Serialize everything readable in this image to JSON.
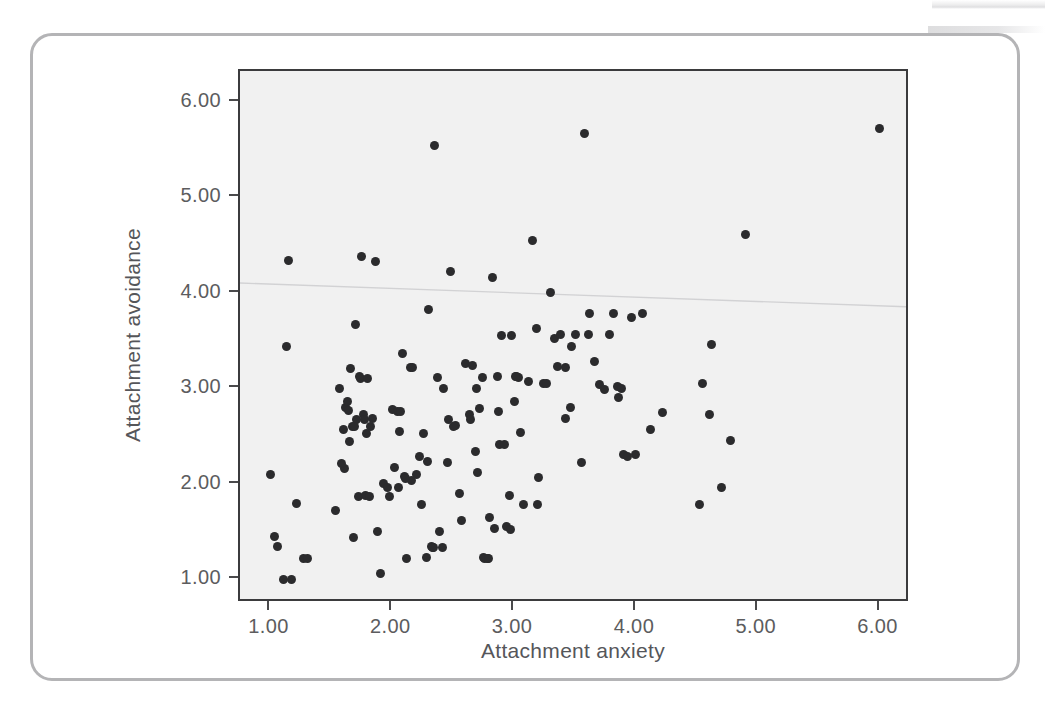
{
  "figure": {
    "background_color": "#ffffff",
    "card_border_color": "#b4b4b6",
    "panel_background_color": "#f1f1f1",
    "panel_border_color": "#3b3b3d",
    "point_color": "#2b2b2d",
    "fit_line_color": "#d2d2d4"
  },
  "chart_data": {
    "type": "scatter",
    "title": "",
    "xlabel": "Attachment anxiety",
    "ylabel": "Attachment avoidance",
    "xlim": [
      0.75,
      6.25
    ],
    "ylim": [
      0.75,
      6.32
    ],
    "xticks": [
      1.0,
      2.0,
      3.0,
      4.0,
      5.0,
      6.0
    ],
    "yticks": [
      1.0,
      2.0,
      3.0,
      4.0,
      5.0,
      6.0
    ],
    "xtick_labels": [
      "1.00",
      "2.00",
      "3.00",
      "4.00",
      "5.00",
      "6.00"
    ],
    "ytick_labels": [
      "1.00",
      "2.00",
      "3.00",
      "4.00",
      "5.00",
      "6.00"
    ],
    "grid": false,
    "legend": null,
    "n_points": 152,
    "marker": "filled-circle",
    "fit_line": {
      "visible": true,
      "x": [
        0.75,
        6.25
      ],
      "y": [
        4.1,
        3.85
      ],
      "note": "faint near-flat reference line"
    },
    "points": [
      [
        1.0,
        2.1
      ],
      [
        1.03,
        1.45
      ],
      [
        1.06,
        1.34
      ],
      [
        1.11,
        1.0
      ],
      [
        1.13,
        3.44
      ],
      [
        1.15,
        4.34
      ],
      [
        1.17,
        1.0
      ],
      [
        1.21,
        1.79
      ],
      [
        1.27,
        1.22
      ],
      [
        1.3,
        1.22
      ],
      [
        1.53,
        1.72
      ],
      [
        1.57,
        3.0
      ],
      [
        1.6,
        2.57
      ],
      [
        1.61,
        2.16
      ],
      [
        1.62,
        2.8
      ],
      [
        1.63,
        2.86
      ],
      [
        1.65,
        2.44
      ],
      [
        1.66,
        3.21
      ],
      [
        1.67,
        2.6
      ],
      [
        1.68,
        1.44
      ],
      [
        1.7,
        3.67
      ],
      [
        1.71,
        2.67
      ],
      [
        1.72,
        1.86
      ],
      [
        1.74,
        3.1
      ],
      [
        1.75,
        4.38
      ],
      [
        1.76,
        2.72
      ],
      [
        1.77,
        2.67
      ],
      [
        1.78,
        1.88
      ],
      [
        1.8,
        3.1
      ],
      [
        1.82,
        2.6
      ],
      [
        1.84,
        2.68
      ],
      [
        1.86,
        4.33
      ],
      [
        1.88,
        1.5
      ],
      [
        1.9,
        1.06
      ],
      [
        1.93,
        2.0
      ],
      [
        1.96,
        1.96
      ],
      [
        1.98,
        1.86
      ],
      [
        2.0,
        2.78
      ],
      [
        2.02,
        2.17
      ],
      [
        2.04,
        2.76
      ],
      [
        2.06,
        2.55
      ],
      [
        2.08,
        3.36
      ],
      [
        2.1,
        2.07
      ],
      [
        2.12,
        1.22
      ],
      [
        2.15,
        3.22
      ],
      [
        2.17,
        3.22
      ],
      [
        2.2,
        2.1
      ],
      [
        2.22,
        2.28
      ],
      [
        2.24,
        1.78
      ],
      [
        2.26,
        2.52
      ],
      [
        2.28,
        1.23
      ],
      [
        2.3,
        3.82
      ],
      [
        2.32,
        1.34
      ],
      [
        2.34,
        1.33
      ],
      [
        2.35,
        5.54
      ],
      [
        2.37,
        3.11
      ],
      [
        2.39,
        1.5
      ],
      [
        2.42,
        3.0
      ],
      [
        2.46,
        2.67
      ],
      [
        2.48,
        4.22
      ],
      [
        2.52,
        2.61
      ],
      [
        2.55,
        1.9
      ],
      [
        2.57,
        1.61
      ],
      [
        2.6,
        3.26
      ],
      [
        2.63,
        2.72
      ],
      [
        2.66,
        3.24
      ],
      [
        2.68,
        2.34
      ],
      [
        2.7,
        2.12
      ],
      [
        2.72,
        2.79
      ],
      [
        2.74,
        3.11
      ],
      [
        2.76,
        1.22
      ],
      [
        2.78,
        1.22
      ],
      [
        2.8,
        1.64
      ],
      [
        2.82,
        4.16
      ],
      [
        2.84,
        1.53
      ],
      [
        2.86,
        3.12
      ],
      [
        2.88,
        2.41
      ],
      [
        2.9,
        3.55
      ],
      [
        2.92,
        2.41
      ],
      [
        2.94,
        1.55
      ],
      [
        2.96,
        1.88
      ],
      [
        2.98,
        3.55
      ],
      [
        3.0,
        2.86
      ],
      [
        3.02,
        3.12
      ],
      [
        3.05,
        2.54
      ],
      [
        3.08,
        1.78
      ],
      [
        3.12,
        3.07
      ],
      [
        3.15,
        4.55
      ],
      [
        3.18,
        3.62
      ],
      [
        3.2,
        2.06
      ],
      [
        3.24,
        3.05
      ],
      [
        3.3,
        4.0
      ],
      [
        3.33,
        3.52
      ],
      [
        3.36,
        3.23
      ],
      [
        3.38,
        3.56
      ],
      [
        3.42,
        2.68
      ],
      [
        3.46,
        2.8
      ],
      [
        3.5,
        3.56
      ],
      [
        3.55,
        2.22
      ],
      [
        3.58,
        5.67
      ],
      [
        3.62,
        3.78
      ],
      [
        3.66,
        3.28
      ],
      [
        3.7,
        3.04
      ],
      [
        3.74,
        2.99
      ],
      [
        3.78,
        3.56
      ],
      [
        3.82,
        3.78
      ],
      [
        3.86,
        2.9
      ],
      [
        3.9,
        2.31
      ],
      [
        3.93,
        2.28
      ],
      [
        3.96,
        3.74
      ],
      [
        4.05,
        3.78
      ],
      [
        4.12,
        2.57
      ],
      [
        4.22,
        2.74
      ],
      [
        4.52,
        1.78
      ],
      [
        4.55,
        3.05
      ],
      [
        4.6,
        2.72
      ],
      [
        4.62,
        3.46
      ],
      [
        4.7,
        1.96
      ],
      [
        4.78,
        2.45
      ],
      [
        4.9,
        4.61
      ],
      [
        6.0,
        5.72
      ],
      [
        1.58,
        2.21
      ],
      [
        1.79,
        2.52
      ],
      [
        2.05,
        1.96
      ],
      [
        2.16,
        2.03
      ],
      [
        2.45,
        2.22
      ],
      [
        2.69,
        3.0
      ],
      [
        2.87,
        2.76
      ],
      [
        3.04,
        3.11
      ],
      [
        3.42,
        3.22
      ],
      [
        3.85,
        3.02
      ],
      [
        2.11,
        2.05
      ],
      [
        2.41,
        1.33
      ],
      [
        2.75,
        1.23
      ],
      [
        2.97,
        1.52
      ],
      [
        3.19,
        1.78
      ],
      [
        1.81,
        1.86
      ],
      [
        1.64,
        2.77
      ],
      [
        1.73,
        3.12
      ],
      [
        2.07,
        2.76
      ],
      [
        2.29,
        2.23
      ],
      [
        2.64,
        2.67
      ],
      [
        3.01,
        3.12
      ],
      [
        3.47,
        3.44
      ],
      [
        3.88,
        3.0
      ],
      [
        4.0,
        2.3
      ],
      [
        1.69,
        2.6
      ],
      [
        2.33,
        1.33
      ],
      [
        2.79,
        1.22
      ],
      [
        3.27,
        3.05
      ],
      [
        3.61,
        3.56
      ],
      [
        2.5,
        2.6
      ]
    ]
  }
}
